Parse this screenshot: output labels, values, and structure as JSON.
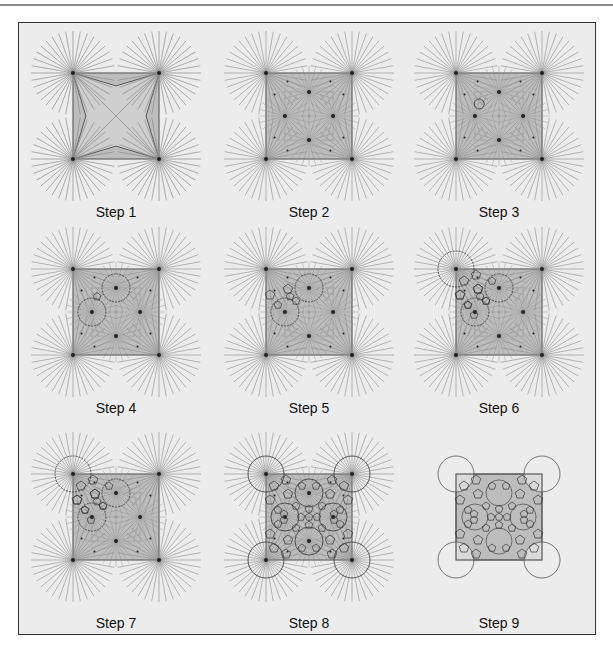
{
  "figure": {
    "title": "",
    "colors": {
      "background": "#ececec",
      "frame": "#333333",
      "square_fill": "#bdbdbd",
      "square_stroke": "#555555",
      "ray": "#8c8c8c",
      "curve": "#333333"
    },
    "panels": [
      {
        "id": 1,
        "label": "Step 1",
        "description": "Four corner points with radiating rays; square with star-shaped ray intersections"
      },
      {
        "id": 2,
        "label": "Step 2",
        "description": "Added four interior radiating points and eight small dots inside the square"
      },
      {
        "id": 3,
        "label": "Step 3",
        "description": "First small circle drawn between upper-left interior points"
      },
      {
        "id": 4,
        "label": "Step 4",
        "description": "Two large circles around top and left interior points, small connecting circle"
      },
      {
        "id": 5,
        "label": "Step 5",
        "description": "Polygon cells forming between circles"
      },
      {
        "id": 6,
        "label": "Step 6",
        "description": "Circle added around top-left corner point"
      },
      {
        "id": 7,
        "label": "Step 7",
        "description": "More polygon cells filling the upper-left region"
      },
      {
        "id": 8,
        "label": "Step 8",
        "description": "Full pattern of circles and polygon cells over all points"
      },
      {
        "id": 9,
        "label": "Step 9",
        "description": "Final tiling: circles and polygons without rays"
      }
    ]
  }
}
